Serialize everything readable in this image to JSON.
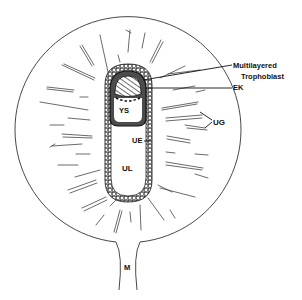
{
  "figure": {
    "colors": {
      "line": "#222222",
      "background": "#ffffff",
      "fill_dark": "#111111"
    },
    "labels": {
      "multilayered": "Multilayered",
      "trophoblast": "Trophoblast",
      "ek": "EK",
      "ys": "YS",
      "ug": "UG",
      "ue": "UE",
      "ul": "UL",
      "m": "M"
    }
  }
}
